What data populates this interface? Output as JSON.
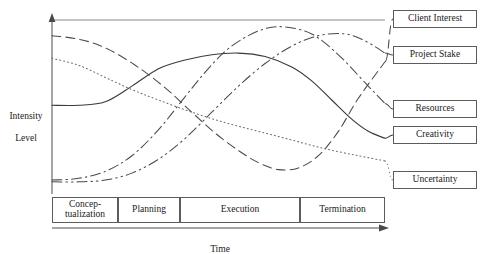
{
  "chart_data": {
    "type": "line",
    "title": "",
    "xlabel": "Time",
    "ylabel": "Intensity\nLevel",
    "xlim": [
      0,
      100
    ],
    "ylim": [
      0,
      100
    ],
    "grid": false,
    "legend_position": "right",
    "x_phase_categories": [
      {
        "label": "Concep-\ntualization",
        "start": 0,
        "end": 20
      },
      {
        "label": "Planning",
        "start": 20,
        "end": 38.5
      },
      {
        "label": "Execution",
        "start": 38.5,
        "end": 74.5
      },
      {
        "label": "Termination",
        "start": 74.5,
        "end": 100
      }
    ],
    "series": [
      {
        "name": "Client Interest",
        "style": "dashed",
        "color": "#4a4a4a",
        "x": [
          0,
          8,
          16,
          25,
          34,
          42,
          49,
          56,
          62,
          68,
          74,
          80,
          86,
          92,
          100
        ],
        "y": [
          91,
          89,
          84,
          74,
          61,
          47,
          35,
          25,
          18,
          14,
          15,
          22,
          36,
          55,
          76
        ]
      },
      {
        "name": "Project Stake",
        "style": "dash-dot-dot",
        "color": "#4a4a4a",
        "x": [
          0,
          8,
          16,
          24,
          32,
          40,
          48,
          56,
          64,
          72,
          80,
          88,
          94,
          100
        ],
        "y": [
          7,
          7,
          8,
          12,
          20,
          32,
          47,
          62,
          75,
          85,
          91,
          92,
          88,
          81
        ]
      },
      {
        "name": "Resources",
        "style": "dash-dot",
        "color": "#4a4a4a",
        "x": [
          0,
          8,
          16,
          24,
          32,
          40,
          46,
          52,
          58,
          64,
          70,
          78,
          86,
          94,
          100
        ],
        "y": [
          8,
          9,
          13,
          22,
          37,
          56,
          70,
          82,
          90,
          95,
          96,
          92,
          80,
          64,
          52
        ]
      },
      {
        "name": "Creativity",
        "style": "solid",
        "color": "#3a3a3a",
        "x": [
          0,
          8,
          16,
          24,
          32,
          40,
          48,
          56,
          64,
          72,
          78,
          84,
          90,
          95,
          100
        ],
        "y": [
          51,
          51,
          53,
          62,
          72,
          77,
          80,
          81,
          79,
          73,
          65,
          54,
          43,
          36,
          32
        ]
      },
      {
        "name": "Uncertainty",
        "style": "dotted",
        "color": "#6a6a6a",
        "x": [
          0,
          8,
          16,
          24,
          32,
          42,
          52,
          62,
          72,
          82,
          92,
          100
        ],
        "y": [
          78,
          74,
          67,
          60,
          54,
          47,
          41,
          36,
          31,
          26,
          22,
          19
        ]
      }
    ]
  },
  "legend": {
    "items": [
      {
        "label": "Client Interest"
      },
      {
        "label": "Project Stake"
      },
      {
        "label": "Resources"
      },
      {
        "label": "Creativity"
      },
      {
        "label": "Uncertainty"
      }
    ]
  },
  "phases": {
    "items": [
      {
        "label_line1": "Concep-",
        "label_line2": "tualization",
        "label": "Concep- tualization"
      },
      {
        "label_line1": "Planning",
        "label_line2": "",
        "label": "Planning"
      },
      {
        "label_line1": "Execution",
        "label_line2": "",
        "label": "Execution"
      },
      {
        "label_line1": "Termination",
        "label_line2": "",
        "label": "Termination"
      }
    ]
  },
  "axes": {
    "y_label_line1": "Intensity",
    "y_label_line2": "Level",
    "x_label": "Time"
  }
}
